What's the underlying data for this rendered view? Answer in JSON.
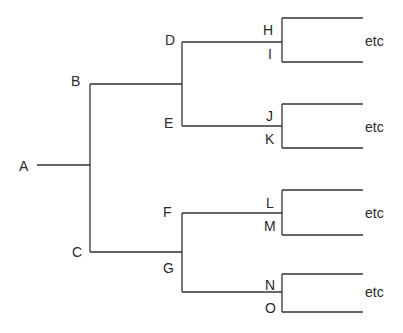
{
  "diagram": {
    "type": "binary-tree",
    "line_color": "#333333",
    "nodes": {
      "A": "A",
      "B": "B",
      "C": "C",
      "D": "D",
      "E": "E",
      "F": "F",
      "G": "G",
      "H": "H",
      "I": "I",
      "J": "J",
      "K": "K",
      "L": "L",
      "M": "M",
      "N": "N",
      "O": "O"
    },
    "etc_labels": [
      "etc",
      "etc",
      "etc",
      "etc"
    ],
    "edges": [
      [
        "A",
        "B"
      ],
      [
        "A",
        "C"
      ],
      [
        "B",
        "D"
      ],
      [
        "B",
        "E"
      ],
      [
        "C",
        "F"
      ],
      [
        "C",
        "G"
      ],
      [
        "D",
        "H"
      ],
      [
        "D",
        "I"
      ],
      [
        "E",
        "J"
      ],
      [
        "E",
        "K"
      ],
      [
        "F",
        "L"
      ],
      [
        "F",
        "M"
      ],
      [
        "G",
        "N"
      ],
      [
        "G",
        "O"
      ]
    ]
  }
}
